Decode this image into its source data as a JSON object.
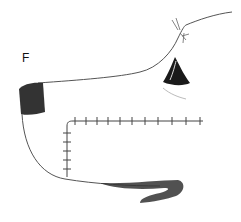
{
  "figure": {
    "panel_label": "F",
    "colors": {
      "ink": "#333333",
      "dark_fill": "#222222",
      "suture": "#444444"
    }
  }
}
